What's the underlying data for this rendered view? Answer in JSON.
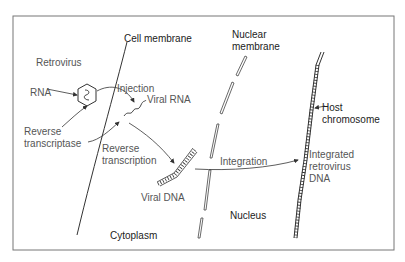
{
  "diagram": {
    "labels": {
      "cell_membrane": "Cell membrane",
      "nuclear_membrane_1": "Nuclear",
      "nuclear_membrane_2": "membrane",
      "retrovirus": "Retrovirus",
      "rna": "RNA",
      "injection": "Injection",
      "viral_rna": "Viral RNA",
      "reverse_transcriptase_1": "Reverse",
      "reverse_transcriptase_2": "transcriptase",
      "reverse_transcription_1": "Reverse",
      "reverse_transcription_2": "transcription",
      "viral_dna": "Viral DNA",
      "integration": "Integration",
      "host_chromosome_1": "Host",
      "host_chromosome_2": "chromosome",
      "integrated_1": "Integrated",
      "integrated_2": "retrovirus",
      "integrated_3": "DNA",
      "nucleus": "Nucleus",
      "cytoplasm": "Cytoplasm"
    },
    "colors": {
      "line": "#333333",
      "text": "#555555",
      "border": "#777777"
    }
  }
}
